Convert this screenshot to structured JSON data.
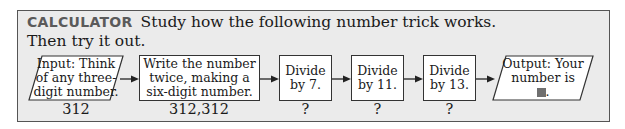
{
  "header": {
    "tag": "CALCULATOR",
    "instruction_line1": "Study how the following number trick works.",
    "instruction_line2": "Then try it out."
  },
  "flowchart": {
    "steps": [
      {
        "shape": "parallelogram",
        "lines": [
          "Input: Think",
          "of any three-",
          "digit number."
        ],
        "value": "312"
      },
      {
        "shape": "rectangle",
        "lines": [
          "Write the number",
          "twice, making a",
          "six-digit number."
        ],
        "value": "312,312"
      },
      {
        "shape": "rectangle",
        "lines": [
          "Divide",
          "by 7."
        ],
        "value": "?"
      },
      {
        "shape": "rectangle",
        "lines": [
          "Divide",
          "by 11."
        ],
        "value": "?"
      },
      {
        "shape": "rectangle",
        "lines": [
          "Divide",
          "by 13."
        ],
        "value": "?"
      },
      {
        "shape": "parallelogram",
        "lines": [
          "Output: Your",
          "number is",
          "."
        ],
        "value": ""
      }
    ],
    "output_blank_color": "#6f6f6f"
  },
  "colors": {
    "panel_bg": "#ebebeb",
    "panel_border": "#555555",
    "tag_color": "#5a5a5a",
    "box_bg": "#ffffff"
  }
}
